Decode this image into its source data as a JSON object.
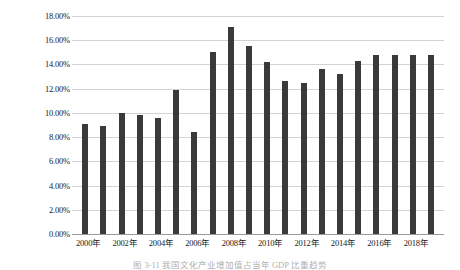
{
  "chart_data": {
    "type": "bar",
    "title": "",
    "xlabel": "",
    "ylabel": "",
    "ylim": [
      0,
      18
    ],
    "grid": true,
    "legend": "none",
    "bar_color": "#3a3a3a",
    "gridline_color": "#d2d2d2",
    "y_ticks": [
      "0.00%",
      "2.00%",
      "4.00%",
      "6.00%",
      "8.00%",
      "10.00%",
      "12.00%",
      "14.00%",
      "16.00%",
      "18.00%"
    ],
    "y_tick_values": [
      0,
      2,
      4,
      6,
      8,
      10,
      12,
      14,
      16,
      18
    ],
    "categories": [
      "2000年",
      "2001年",
      "2002年",
      "2003年",
      "2004年",
      "2005年",
      "2006年",
      "2007年",
      "2008年",
      "2009年",
      "2010年",
      "2011年",
      "2012年",
      "2013年",
      "2014年",
      "2015年",
      "2016年",
      "2017年",
      "2018年",
      "2019年"
    ],
    "x_tick_labels": [
      "2000年",
      "",
      "2002年",
      "",
      "2004年",
      "",
      "2006年",
      "",
      "2008年",
      "",
      "2010年",
      "",
      "2012年",
      "",
      "2014年",
      "",
      "2016年",
      "",
      "2018年",
      ""
    ],
    "values": [
      9.1,
      8.9,
      10.0,
      9.8,
      9.6,
      11.9,
      8.4,
      15.0,
      17.1,
      15.5,
      14.2,
      12.6,
      12.5,
      13.6,
      13.2,
      14.3,
      14.8,
      14.8,
      14.8,
      14.8
    ]
  },
  "caption": {
    "text": "图 3-11  我国文化产业增加值占当年 GDP 比重趋势"
  }
}
